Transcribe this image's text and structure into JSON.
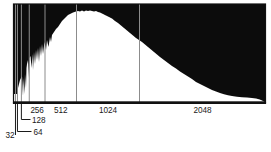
{
  "chart_data": {
    "type": "area",
    "subtype": "histogram",
    "fill_mode": "above-curve",
    "title": "",
    "xlabel": "",
    "ylabel": "",
    "legend": null,
    "colors": {
      "histogram_fill": "#0c0c0c",
      "background": "#ffffff",
      "gridline": "#8c8c8c",
      "frame": "#111111",
      "label": "#1a1a1a"
    },
    "x_axis": {
      "scale": "linear",
      "min": 0,
      "max": 4096,
      "gridlines": [
        {
          "value": 32,
          "label": "32",
          "label_placement": "callout"
        },
        {
          "value": 64,
          "label": "64",
          "label_placement": "callout"
        },
        {
          "value": 128,
          "label": "128",
          "label_placement": "callout"
        },
        {
          "value": 256,
          "label": "256",
          "label_placement": "between"
        },
        {
          "value": 512,
          "label": "512",
          "label_placement": "between"
        },
        {
          "value": 1024,
          "label": "1024",
          "label_placement": "between"
        },
        {
          "value": 2048,
          "label": "2048",
          "label_placement": "between"
        }
      ]
    },
    "y_axis": {
      "visible": false,
      "min": 0,
      "max": 1
    },
    "ylim": [
      0,
      1
    ],
    "points": [
      [
        0,
        0.082
      ],
      [
        63,
        0.082
      ],
      [
        73,
        0.143
      ],
      [
        106,
        0.224
      ],
      [
        138,
        0.265
      ],
      [
        154,
        0.061
      ],
      [
        163,
        0.245
      ],
      [
        179,
        0.082
      ],
      [
        187,
        0.286
      ],
      [
        203,
        0.143
      ],
      [
        211,
        0.347
      ],
      [
        219,
        0.388
      ],
      [
        236,
        0.429
      ],
      [
        252,
        0.245
      ],
      [
        260,
        0.449
      ],
      [
        276,
        0.469
      ],
      [
        293,
        0.347
      ],
      [
        309,
        0.49
      ],
      [
        317,
        0.327
      ],
      [
        333,
        0.51
      ],
      [
        349,
        0.388
      ],
      [
        366,
        0.531
      ],
      [
        382,
        0.429
      ],
      [
        398,
        0.551
      ],
      [
        414,
        0.408
      ],
      [
        431,
        0.571
      ],
      [
        447,
        0.469
      ],
      [
        463,
        0.592
      ],
      [
        480,
        0.49
      ],
      [
        504,
        0.612
      ],
      [
        528,
        0.531
      ],
      [
        545,
        0.633
      ],
      [
        569,
        0.561
      ],
      [
        593,
        0.663
      ],
      [
        610,
        0.612
      ],
      [
        626,
        0.684
      ],
      [
        658,
        0.714
      ],
      [
        691,
        0.745
      ],
      [
        723,
        0.765
      ],
      [
        756,
        0.796
      ],
      [
        788,
        0.827
      ],
      [
        821,
        0.847
      ],
      [
        853,
        0.867
      ],
      [
        886,
        0.888
      ],
      [
        918,
        0.898
      ],
      [
        967,
        0.913
      ],
      [
        1016,
        0.923
      ],
      [
        1048,
        0.929
      ],
      [
        1081,
        0.923
      ],
      [
        1113,
        0.934
      ],
      [
        1146,
        0.923
      ],
      [
        1178,
        0.934
      ],
      [
        1211,
        0.929
      ],
      [
        1243,
        0.934
      ],
      [
        1276,
        0.929
      ],
      [
        1308,
        0.923
      ],
      [
        1341,
        0.929
      ],
      [
        1373,
        0.918
      ],
      [
        1406,
        0.913
      ],
      [
        1455,
        0.898
      ],
      [
        1503,
        0.883
      ],
      [
        1552,
        0.867
      ],
      [
        1601,
        0.852
      ],
      [
        1650,
        0.827
      ],
      [
        1698,
        0.806
      ],
      [
        1747,
        0.781
      ],
      [
        1796,
        0.755
      ],
      [
        1845,
        0.73
      ],
      [
        1893,
        0.704
      ],
      [
        1942,
        0.679
      ],
      [
        1991,
        0.653
      ],
      [
        2040,
        0.633
      ],
      [
        2088,
        0.612
      ],
      [
        2137,
        0.587
      ],
      [
        2186,
        0.561
      ],
      [
        2235,
        0.536
      ],
      [
        2284,
        0.51
      ],
      [
        2333,
        0.485
      ],
      [
        2381,
        0.459
      ],
      [
        2446,
        0.429
      ],
      [
        2511,
        0.398
      ],
      [
        2576,
        0.367
      ],
      [
        2641,
        0.342
      ],
      [
        2706,
        0.311
      ],
      [
        2771,
        0.286
      ],
      [
        2836,
        0.26
      ],
      [
        2901,
        0.235
      ],
      [
        2966,
        0.204
      ],
      [
        3031,
        0.184
      ],
      [
        3096,
        0.163
      ],
      [
        3161,
        0.143
      ],
      [
        3226,
        0.122
      ],
      [
        3291,
        0.107
      ],
      [
        3356,
        0.092
      ],
      [
        3421,
        0.079
      ],
      [
        3486,
        0.068
      ],
      [
        3551,
        0.061
      ],
      [
        3633,
        0.054
      ],
      [
        3714,
        0.049
      ],
      [
        3795,
        0.045
      ],
      [
        3877,
        0.041
      ],
      [
        3942,
        0.036
      ],
      [
        3990,
        0.029
      ],
      [
        4023,
        0.02
      ],
      [
        4055,
        0.01
      ],
      [
        4085,
        0.0
      ],
      [
        4096,
        0.0
      ]
    ]
  }
}
